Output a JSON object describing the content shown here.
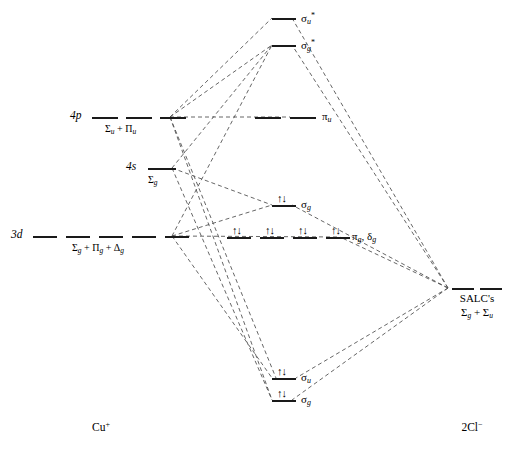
{
  "diagram": {
    "left_fragment": "Cu+",
    "left_fragment_text": "Cu",
    "left_fragment_charge": "+",
    "right_fragment_text": "2Cl",
    "right_fragment_charge": "−",
    "line_color": "#1a1a1a",
    "dash_color": "#4a4a4a"
  },
  "atomic_orbitals": [
    {
      "id": "4p",
      "name": "4p",
      "name_n": "4",
      "name_l": "p",
      "symmetry": "Σu + Πu",
      "symmetry_parts": [
        {
          "greek": "Σ",
          "sub": "u"
        },
        {
          "op": " + "
        },
        {
          "greek": "Π",
          "sub": "u"
        }
      ],
      "degeneracy": 3
    },
    {
      "id": "4s",
      "name": "4s",
      "name_n": "4",
      "name_l": "s",
      "symmetry": "Σg",
      "symmetry_parts": [
        {
          "greek": "Σ",
          "sub": "g"
        }
      ],
      "degeneracy": 1
    },
    {
      "id": "3d",
      "name": "3d",
      "name_n": "3",
      "name_l": "d",
      "symmetry": "Σg + Πg + Δg",
      "symmetry_parts": [
        {
          "greek": "Σ",
          "sub": "g"
        },
        {
          "op": " + "
        },
        {
          "greek": "Π",
          "sub": "g"
        },
        {
          "op": " + "
        },
        {
          "greek": "Δ",
          "sub": "g"
        }
      ],
      "degeneracy": 5
    }
  ],
  "molecular_orbitals": [
    {
      "id": "sigma-u-star",
      "label": "σu*",
      "greek": "σ",
      "sub": "u",
      "sup": "*",
      "degeneracy": 1,
      "electrons": 0
    },
    {
      "id": "sigma-g-star",
      "label": "σg*",
      "greek": "σ",
      "sub": "g",
      "sup": "*",
      "degeneracy": 1,
      "electrons": 0
    },
    {
      "id": "pi-u",
      "label": "πu",
      "greek": "π",
      "sub": "u",
      "sup": "",
      "degeneracy": 2,
      "electrons": 0
    },
    {
      "id": "sigma-g-nb",
      "label": "σg",
      "greek": "σ",
      "sub": "g",
      "sup": "",
      "degeneracy": 1,
      "electrons": 2
    },
    {
      "id": "pi-g-delta-g",
      "label": "πg, δg",
      "greek": "π",
      "sub": "g",
      "greek2": "δ",
      "sub2": "g",
      "degeneracy": 4,
      "electrons": 8
    },
    {
      "id": "sigma-u-bonding",
      "label": "σu",
      "greek": "σ",
      "sub": "u",
      "sup": "",
      "degeneracy": 1,
      "electrons": 2
    },
    {
      "id": "sigma-g-bonding",
      "label": "σg",
      "greek": "σ",
      "sub": "g",
      "sup": "",
      "degeneracy": 1,
      "electrons": 2
    }
  ],
  "salc": {
    "caption": "SALC's",
    "symmetry": "Σg + Σu",
    "symmetry_parts": [
      {
        "greek": "Σ",
        "sub": "g"
      },
      {
        "op": " + "
      },
      {
        "greek": "Σ",
        "sub": "u"
      }
    ],
    "degeneracy": 2
  },
  "electron_pair_glyph": "↑↓"
}
